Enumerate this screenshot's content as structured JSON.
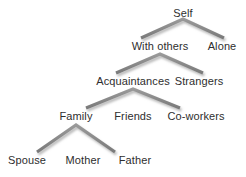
{
  "diagram": {
    "type": "tree",
    "background_color": "#ffffff",
    "text_color": "#2e2e2e",
    "connector_color": "#8a8a8a",
    "connector_shadow_color": "#c9c9c9",
    "levels": [
      {
        "index": 0,
        "nodes": [
          {
            "id": "self",
            "label": "Self",
            "x": 183,
            "y": 13
          }
        ]
      },
      {
        "index": 1,
        "nodes": [
          {
            "id": "with-others",
            "label": "With others",
            "x": 160,
            "y": 46
          },
          {
            "id": "alone",
            "label": "Alone",
            "x": 222,
            "y": 46
          }
        ]
      },
      {
        "index": 2,
        "nodes": [
          {
            "id": "acquaintances",
            "label": "Acquaintances",
            "x": 133,
            "y": 81
          },
          {
            "id": "strangers",
            "label": "Strangers",
            "x": 199,
            "y": 81
          }
        ]
      },
      {
        "index": 3,
        "nodes": [
          {
            "id": "family",
            "label": "Family",
            "x": 76,
            "y": 116
          },
          {
            "id": "friends",
            "label": "Friends",
            "x": 133,
            "y": 116
          },
          {
            "id": "co-workers",
            "label": "Co-workers",
            "x": 196,
            "y": 116
          }
        ]
      },
      {
        "index": 4,
        "nodes": [
          {
            "id": "spouse",
            "label": "Spouse",
            "x": 27,
            "y": 160
          },
          {
            "id": "mother",
            "label": "Mother",
            "x": 83,
            "y": 160
          },
          {
            "id": "father",
            "label": "Father",
            "x": 135,
            "y": 160
          }
        ]
      }
    ],
    "edges": [
      {
        "from": "self",
        "to": "with-others"
      },
      {
        "from": "self",
        "to": "alone"
      },
      {
        "from": "with-others",
        "to": "acquaintances"
      },
      {
        "from": "with-others",
        "to": "strangers"
      },
      {
        "from": "acquaintances",
        "to": "family"
      },
      {
        "from": "acquaintances",
        "to": "friends"
      },
      {
        "from": "acquaintances",
        "to": "co-workers"
      },
      {
        "from": "family",
        "to": "spouse"
      },
      {
        "from": "family",
        "to": "mother"
      },
      {
        "from": "family",
        "to": "father"
      }
    ],
    "connector_paths": [
      {
        "id": "connector-self",
        "d": "M 141 38 L 183 19 L 224 38"
      },
      {
        "id": "connector-with-others",
        "d": "M 116 73 L 160 54 L 203 73"
      },
      {
        "id": "connector-acquaintances-left",
        "d": "M 86 108 L 133 89 L 180 108"
      },
      {
        "id": "connector-acquaintances-stem",
        "d": "M 133 89 L 133 108"
      },
      {
        "id": "connector-family-left",
        "d": "M 37 152 L 76 124 L 115 152"
      },
      {
        "id": "connector-family-stem",
        "d": "M 76 124 L 76 152"
      }
    ]
  }
}
